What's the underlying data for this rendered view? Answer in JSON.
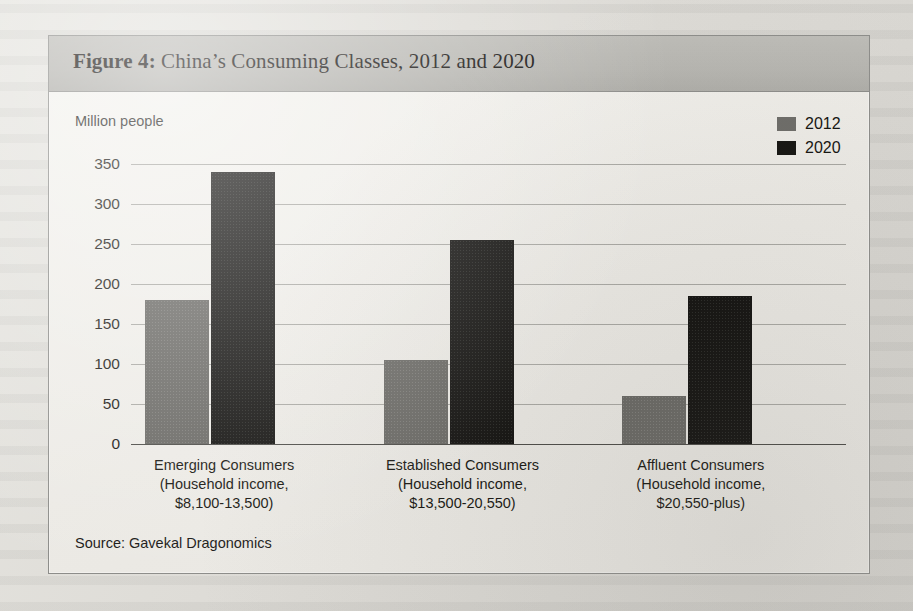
{
  "figure": {
    "title_prefix": "Figure 4:",
    "title_text": " China’s Consuming Classes, 2012 and 2020",
    "source": "Source: Gavekal Dragonomics"
  },
  "legend": {
    "items": [
      {
        "label": "2012",
        "color": "#6d6c68"
      },
      {
        "label": "2020",
        "color": "#141310"
      }
    ]
  },
  "chart_data": {
    "type": "bar",
    "title": "Figure 4: China’s Consuming Classes, 2012 and 2020",
    "ylabel": "Million people",
    "xlabel": "",
    "ylim": [
      0,
      350
    ],
    "yticks": [
      0,
      50,
      100,
      150,
      200,
      250,
      300,
      350
    ],
    "ytick_labels": [
      "0",
      "50",
      "100",
      "150",
      "200",
      "250",
      "300",
      "350"
    ],
    "grid": true,
    "legend_position": "top-right",
    "categories": [
      "Emerging Consumers (Household income, $8,100-13,500)",
      "Established Consumers (Household income, $13,500-20,550)",
      "Affluent Consumers (Household income, $20,550-plus)"
    ],
    "category_lines": [
      [
        "Emerging Consumers",
        "(Household income,",
        "$8,100-13,500)"
      ],
      [
        "Established Consumers",
        "(Household income,",
        "$13,500-20,550)"
      ],
      [
        "Affluent Consumers",
        "(Household income,",
        "$20,550-plus)"
      ]
    ],
    "series": [
      {
        "name": "2012",
        "color": "#6d6c68",
        "values": [
          180,
          105,
          60
        ]
      },
      {
        "name": "2020",
        "color": "#141310",
        "values": [
          340,
          255,
          185
        ]
      }
    ],
    "source": "Source: Gavekal Dragonomics"
  }
}
